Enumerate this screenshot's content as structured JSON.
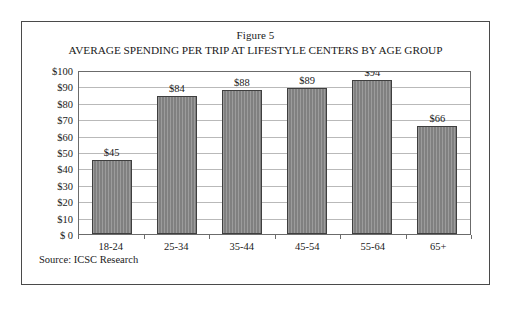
{
  "figure": {
    "caption": "Figure 5",
    "title": "AVERAGE SPENDING PER TRIP AT LIFESTYLE CENTERS BY AGE GROUP",
    "source": "Source: ICSC Research",
    "frame_color": "#4a4a4a"
  },
  "chart_data": {
    "type": "bar",
    "title": "AVERAGE SPENDING PER TRIP AT LIFESTYLE CENTERS BY AGE GROUP",
    "subtitle": "Figure 5",
    "categories": [
      "18-24",
      "25-34",
      "35-44",
      "45-54",
      "55-64",
      "65+"
    ],
    "values": [
      45,
      84,
      88,
      89,
      94,
      66
    ],
    "value_labels": [
      "$45",
      "$84",
      "$88",
      "$89",
      "$94",
      "$66"
    ],
    "xlabel": "",
    "ylabel": "",
    "ylim": [
      0,
      100
    ],
    "ytick_step": 10,
    "ytick_labels": [
      "$100",
      "$90",
      "$80",
      "$70",
      "$60",
      "$50",
      "$40",
      "$30",
      "$20",
      "$10",
      "$ 0"
    ],
    "ytick_values": [
      100,
      90,
      80,
      70,
      60,
      50,
      40,
      30,
      20,
      10,
      0
    ],
    "grid": true,
    "legend": false,
    "bar_color": "#808080",
    "bar_edge_color": "#3f3f3f",
    "gridline_color": "#b9b9b9",
    "axis_color": "#6b6b6b",
    "series": [
      {
        "name": "Average spending per trip",
        "values": [
          45,
          84,
          88,
          89,
          94,
          66
        ]
      }
    ]
  }
}
